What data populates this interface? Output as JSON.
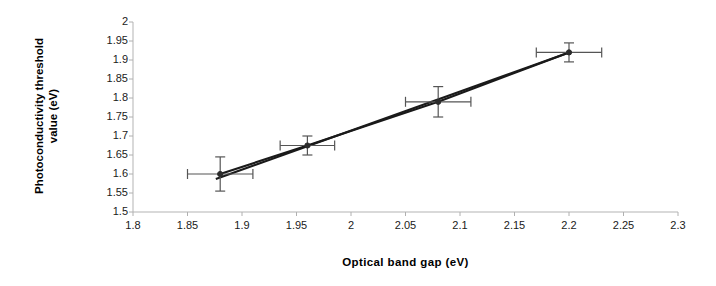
{
  "chart_data": {
    "type": "scatter",
    "title": "",
    "xlabel": "Optical band gap (eV)",
    "ylabel": "Photoconductivity threshold value (eV)",
    "ylabel_lines": [
      "Photoconductivity threshold",
      "value (eV)"
    ],
    "xlim": [
      1.8,
      2.3
    ],
    "ylim": [
      1.5,
      2.0
    ],
    "xticks": [
      "1.8",
      "1.85",
      "1.9",
      "1.95",
      "2",
      "2.05",
      "2.1",
      "2.15",
      "2.2",
      "2.25",
      "2.3"
    ],
    "xtick_values": [
      1.8,
      1.85,
      1.9,
      1.95,
      2.0,
      2.05,
      2.1,
      2.15,
      2.2,
      2.25,
      2.3
    ],
    "yticks": [
      "1.5",
      "1.55",
      "1.6",
      "1.65",
      "1.7",
      "1.75",
      "1.8",
      "1.85",
      "1.9",
      "1.95",
      "2"
    ],
    "ytick_values": [
      1.5,
      1.55,
      1.6,
      1.65,
      1.7,
      1.75,
      1.8,
      1.85,
      1.9,
      1.95,
      2.0
    ],
    "grid": false,
    "legend": false,
    "series": [
      {
        "name": "Photoconductivity threshold vs optical band gap",
        "x": [
          1.88,
          1.96,
          2.08,
          2.2
        ],
        "y": [
          1.6,
          1.675,
          1.79,
          1.92
        ],
        "xerr": [
          0.03,
          0.025,
          0.03,
          0.03
        ],
        "yerr": [
          0.045,
          0.025,
          0.04,
          0.025
        ],
        "marker": "circle",
        "connected": true,
        "color": "#1a1a1a"
      }
    ],
    "trendline": {
      "present": true,
      "x": [
        1.876,
        2.202
      ],
      "y": [
        1.587,
        1.922
      ],
      "color": "#1a1a1a"
    },
    "axis_color": "#b0b0b0",
    "marker_color": "#2b2b2b",
    "errorbar_color": "#555555"
  }
}
